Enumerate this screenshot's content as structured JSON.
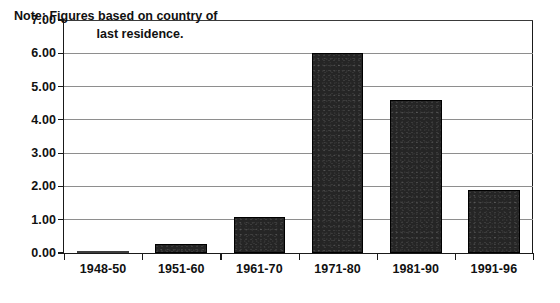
{
  "chart_data": {
    "type": "bar",
    "title": "",
    "subtitle": "",
    "xlabel": "",
    "ylabel": "",
    "categories": [
      "1948-50",
      "1951-60",
      "1961-70",
      "1971-80",
      "1981-90",
      "1991-96"
    ],
    "values": [
      0.03,
      0.26,
      1.07,
      6.0,
      4.6,
      1.88
    ],
    "series": [
      {
        "name": "Immigrants",
        "values": [
          0.03,
          0.26,
          1.07,
          6.0,
          4.6,
          1.88
        ]
      }
    ],
    "ylim": [
      0.0,
      7.0
    ],
    "ytick_step": 1.0,
    "ytick_labels": [
      "0.00",
      "1.00",
      "2.00",
      "3.00",
      "4.00",
      "5.00",
      "6.00",
      "7.00"
    ],
    "ytick_values": [
      0.0,
      1.0,
      2.0,
      3.0,
      4.0,
      5.0,
      6.0,
      7.0
    ],
    "grid": true,
    "grid_axis": "y",
    "legend": false,
    "legend_position": "none",
    "annotations": [
      {
        "name": "country-of-residence-note",
        "lines": [
          "Note: Figures based on country of",
          "last residence."
        ]
      }
    ],
    "colors": {
      "bar_fill": "#252525",
      "bar_outline": "#000000",
      "gridline": "#8e8e8e",
      "axis": "#1a1a1a",
      "text": "#111111",
      "background": "#ffffff"
    }
  }
}
